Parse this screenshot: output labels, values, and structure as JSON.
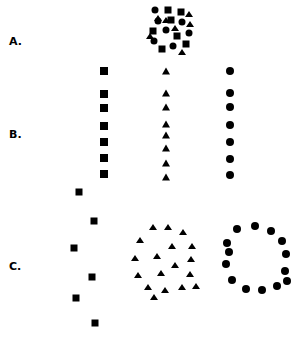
{
  "figure": {
    "width": 305,
    "height": 344,
    "background_color": "#ffffff",
    "marker_color": "#000000"
  },
  "labels": [
    {
      "name": "label-a",
      "text": "A.",
      "x": 9,
      "y": 36
    },
    {
      "name": "label-b",
      "text": "B.",
      "x": 9,
      "y": 129
    },
    {
      "name": "label-c",
      "text": "C.",
      "x": 9,
      "y": 261
    }
  ],
  "chart_data": {
    "type": "scatter",
    "title": "",
    "subtitle": "",
    "xlabel": "",
    "ylabel": "",
    "xlim": [
      0,
      305
    ],
    "ylim": [
      344,
      0
    ],
    "grid": false,
    "legend": "none",
    "axes_visible": false,
    "marker_color": "#000000",
    "panels": [
      {
        "label": "A.",
        "name": "panel-a-mixed-cluster",
        "description": "Random mixed cluster of circles, squares and triangles",
        "series": [
          {
            "name": "circles",
            "marker": "circle",
            "size": 7,
            "points": [
              [
                155,
                10
              ],
              [
                182,
                22
              ],
              [
                166,
                30
              ],
              [
                154,
                41
              ],
              [
                173,
                46
              ],
              [
                189,
                33
              ],
              [
                158,
                21
              ]
            ]
          },
          {
            "name": "squares",
            "marker": "square",
            "size": 7,
            "points": [
              [
                168,
                10
              ],
              [
                181,
                12
              ],
              [
                153,
                31
              ],
              [
                177,
                36
              ],
              [
                162,
                49
              ],
              [
                186,
                44
              ],
              [
                171,
                20
              ]
            ]
          },
          {
            "name": "triangles",
            "marker": "triangle",
            "size": 7,
            "points": [
              [
                189,
                14
              ],
              [
                158,
                18
              ],
              [
                175,
                28
              ],
              [
                166,
                20
              ],
              [
                182,
                52
              ],
              [
                190,
                24
              ],
              [
                150,
                36
              ]
            ]
          }
        ]
      },
      {
        "label": "B.",
        "name": "panel-b-vertical-columns",
        "description": "Three vertical columns: squares (left), triangles (centre), circles (right)",
        "series": [
          {
            "name": "squares-column",
            "marker": "square",
            "size": 8,
            "points": [
              [
                104,
                71
              ],
              [
                104,
                94
              ],
              [
                104,
                108
              ],
              [
                104,
                126
              ],
              [
                104,
                142
              ],
              [
                104,
                158
              ],
              [
                104,
                174
              ]
            ]
          },
          {
            "name": "triangles-column",
            "marker": "triangle",
            "size": 8,
            "points": [
              [
                166,
                71
              ],
              [
                166,
                93
              ],
              [
                166,
                107
              ],
              [
                166,
                124
              ],
              [
                166,
                135
              ],
              [
                166,
                148
              ],
              [
                166,
                163
              ],
              [
                166,
                177
              ]
            ]
          },
          {
            "name": "circles-column",
            "marker": "circle",
            "size": 8,
            "points": [
              [
                230,
                71
              ],
              [
                230,
                93
              ],
              [
                230,
                107
              ],
              [
                230,
                125
              ],
              [
                230,
                142
              ],
              [
                230,
                159
              ],
              [
                230,
                175
              ]
            ]
          }
        ]
      },
      {
        "label": "C.",
        "name": "panel-c-ring-and-zigzag",
        "description": "Zigzag column of squares (left), ring of triangles (centre), ring of circles (right)",
        "series": [
          {
            "name": "squares-zigzag",
            "marker": "square",
            "size": 7,
            "points": [
              [
                79,
                192
              ],
              [
                94,
                221
              ],
              [
                74,
                248
              ],
              [
                92,
                277
              ],
              [
                76,
                298
              ],
              [
                95,
                323
              ]
            ]
          },
          {
            "name": "triangles-ring",
            "marker": "triangle",
            "size": 7,
            "points": [
              [
                153,
                227
              ],
              [
                168,
                227
              ],
              [
                183,
                232
              ],
              [
                140,
                240
              ],
              [
                192,
                246
              ],
              [
                135,
                258
              ],
              [
                172,
                246
              ],
              [
                157,
                256
              ],
              [
                191,
                259
              ],
              [
                138,
                275
              ],
              [
                175,
                265
              ],
              [
                161,
                273
              ],
              [
                190,
                274
              ],
              [
                148,
                287
              ],
              [
                165,
                290
              ],
              [
                182,
                287
              ],
              [
                154,
                297
              ],
              [
                196,
                286
              ]
            ]
          },
          {
            "name": "circles-ring",
            "marker": "circle",
            "size": 8,
            "points": [
              [
                237,
                229
              ],
              [
                255,
                226
              ],
              [
                271,
                231
              ],
              [
                227,
                243
              ],
              [
                282,
                241
              ],
              [
                226,
                264
              ],
              [
                286,
                254
              ],
              [
                232,
                280
              ],
              [
                285,
                271
              ],
              [
                246,
                289
              ],
              [
                262,
                290
              ],
              [
                277,
                286
              ],
              [
                287,
                281
              ],
              [
                229,
                252
              ]
            ]
          }
        ]
      }
    ]
  }
}
